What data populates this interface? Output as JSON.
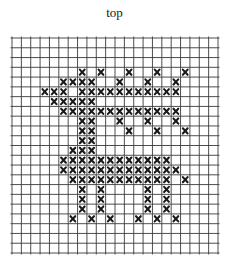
{
  "title": "top",
  "grid": {
    "columns": 22,
    "rows": 22,
    "line_color": "#3a3a3a",
    "stitch_color": "#1a1a1a",
    "stitch_symbol": "×"
  },
  "pattern": {
    "stitches_by_row": [
      {
        "row": 3,
        "cols": [
          7,
          9,
          12,
          15,
          18
        ]
      },
      {
        "row": 4,
        "cols": [
          5,
          6,
          7,
          8,
          11,
          14,
          17
        ]
      },
      {
        "row": 5,
        "cols": [
          3,
          4,
          5,
          7,
          8,
          9,
          10,
          11,
          12,
          13,
          14,
          15,
          16,
          17
        ]
      },
      {
        "row": 6,
        "cols": [
          4,
          5,
          6,
          7,
          8
        ]
      },
      {
        "row": 7,
        "cols": [
          5,
          6,
          7,
          8,
          9,
          10,
          11,
          12,
          13,
          14,
          15,
          16,
          17
        ]
      },
      {
        "row": 8,
        "cols": [
          7,
          8,
          11,
          14,
          17
        ]
      },
      {
        "row": 9,
        "cols": [
          7,
          8,
          12,
          15,
          18
        ]
      },
      {
        "row": 10,
        "cols": [
          7,
          8
        ]
      },
      {
        "row": 11,
        "cols": [
          6,
          7,
          8
        ]
      },
      {
        "row": 12,
        "cols": [
          5,
          6,
          7,
          8,
          9,
          10,
          11,
          12,
          13,
          14,
          15,
          16
        ]
      },
      {
        "row": 13,
        "cols": [
          5,
          6,
          7,
          8,
          9,
          10,
          11,
          12,
          13,
          14,
          15,
          16,
          17
        ]
      },
      {
        "row": 14,
        "cols": [
          6,
          7,
          8,
          9,
          10,
          11,
          12,
          13,
          14,
          15,
          16,
          18
        ]
      },
      {
        "row": 15,
        "cols": [
          7,
          9,
          14,
          16
        ]
      },
      {
        "row": 16,
        "cols": [
          7,
          9,
          14,
          16
        ]
      },
      {
        "row": 17,
        "cols": [
          7,
          9,
          14,
          16
        ]
      },
      {
        "row": 18,
        "cols": [
          6,
          8,
          10,
          13,
          15,
          17
        ]
      }
    ]
  }
}
